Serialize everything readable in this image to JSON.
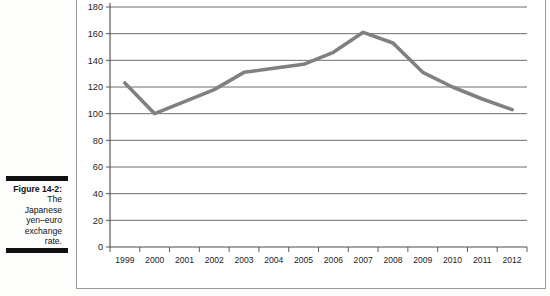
{
  "figure": {
    "caption_label": "Figure 14-2:",
    "caption_lines": [
      "The",
      "Japanese",
      "yen–euro",
      "exchange",
      "rate."
    ]
  },
  "chart_data": {
    "type": "line",
    "title": "",
    "subtitle": "",
    "xlabel": "",
    "ylabel": "",
    "categories": [
      "1999",
      "2000",
      "2001",
      "2002",
      "2003",
      "2004",
      "2005",
      "2006",
      "2007",
      "2008",
      "2009",
      "2010",
      "2011",
      "2012"
    ],
    "values": [
      123,
      100,
      109,
      118,
      131,
      134,
      137,
      146,
      161,
      153,
      131,
      120,
      111,
      103
    ],
    "series": [
      {
        "name": "Japanese yen per euro",
        "values": [
          123,
          100,
          109,
          118,
          131,
          134,
          137,
          146,
          161,
          153,
          131,
          120,
          111,
          103
        ]
      }
    ],
    "ylim": [
      0,
      180
    ],
    "ytick_step": 20,
    "yticks": [
      0,
      20,
      40,
      60,
      80,
      100,
      120,
      140,
      160,
      180
    ],
    "ytick_labels": [
      "0",
      "20",
      "40",
      "60",
      "80",
      "100",
      "120",
      "140",
      "160",
      "180"
    ],
    "xticks": [
      "1999",
      "2000",
      "2001",
      "2002",
      "2003",
      "2004",
      "2005",
      "2006",
      "2007",
      "2008",
      "2009",
      "2010",
      "2011",
      "2012"
    ],
    "grid": true,
    "grid_axis": "y",
    "legend": false,
    "legend_position": "none",
    "line_color": "#808080",
    "grid_color": "#4a4a4a",
    "axis_color": "#4a4a4a",
    "background_color": "#ffffff"
  }
}
